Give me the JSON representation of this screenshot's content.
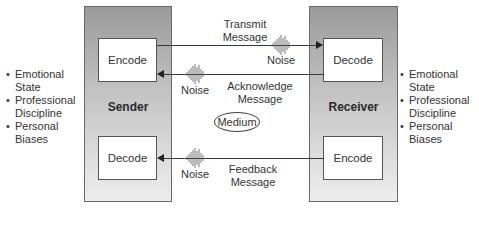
{
  "sender": {
    "title": "Sender",
    "top_box": "Encode",
    "bottom_box": "Decode",
    "traits": [
      "Emotional State",
      "Professional Discipline",
      "Personal Biases"
    ]
  },
  "receiver": {
    "title": "Receiver",
    "top_box": "Decode",
    "bottom_box": "Encode",
    "traits": [
      "Emotional State",
      "Professional Discipline",
      "Personal Biases"
    ]
  },
  "channels": {
    "transmit": {
      "line1": "Transmit",
      "line2": "Message",
      "noise": "Noise",
      "direction": "sender-to-receiver"
    },
    "acknowledge": {
      "line1": "Acknowledge",
      "line2": "Message",
      "noise": "Noise",
      "direction": "receiver-to-sender"
    },
    "feedback": {
      "line1": "Feedback",
      "line2": "Message",
      "noise": "Noise",
      "direction": "receiver-to-sender"
    }
  },
  "medium": "Medium",
  "traits_left": {
    "i0a": "Emotional",
    "i0b": "State",
    "i1a": "Professional",
    "i1b": "Discipline",
    "i2a": "Personal",
    "i2b": "Biases"
  },
  "traits_right": {
    "i0a": "Emotional",
    "i0b": "State",
    "i1a": "Professional",
    "i1b": "Discipline",
    "i2a": "Personal",
    "i2b": "Biases"
  }
}
